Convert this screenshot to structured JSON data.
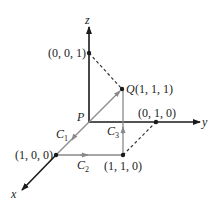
{
  "diagram": {
    "axes": {
      "x_label": "x",
      "y_label": "y",
      "z_label": "z"
    },
    "origin_label": "P",
    "points": {
      "z1": "(0, 0, 1)",
      "q_letter": "Q",
      "q_coords": "(1, 1, 1)",
      "y1": "(0, 1, 0)",
      "x1": "(1, 0, 0)",
      "xy1": "(1, 1, 0)"
    },
    "curves": {
      "c1": "C",
      "c1_sub": "1",
      "c2": "C",
      "c2_sub": "2",
      "c3": "C",
      "c3_sub": "3"
    },
    "colors": {
      "axis": "#1a1a1a",
      "path": "#8a8a8a",
      "dashed": "#333333"
    }
  }
}
